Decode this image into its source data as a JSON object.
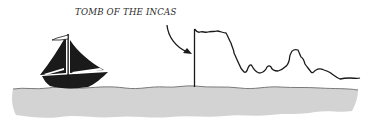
{
  "illustration": {
    "label": "TOMB OF THE INCAS",
    "elements": {
      "ship": "sailing-ship",
      "arrow": "curved-arrow-pointing-to-cliff",
      "cliff": "tall-rock-formation-skyline",
      "water": "grey-sea-band"
    },
    "colors": {
      "ink": "#1a1a1a",
      "water_fill": "#d3d3d3",
      "water_edge": "#6e6e6e",
      "background": "#ffffff"
    }
  }
}
